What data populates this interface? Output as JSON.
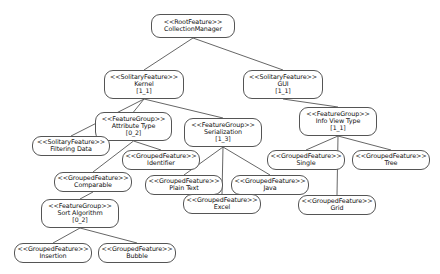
{
  "diagram": {
    "edge_color": "#555555",
    "node_border_color": "#555555",
    "node_fill_color": "#ffffff",
    "background_color": "#ffffff"
  },
  "nodes": [
    {
      "id": "collection-manager",
      "stereotype": "<<RootFeature>>",
      "name": "CollectionManager",
      "cardinality": "",
      "x": 151,
      "y": 14,
      "w": 84,
      "h": 24
    },
    {
      "id": "kernel",
      "stereotype": "<<SolitaryFeature>>",
      "name": "Kernel",
      "cardinality": "[1_1]",
      "x": 104,
      "y": 70,
      "w": 80,
      "h": 29
    },
    {
      "id": "gui",
      "stereotype": "<<SolitaryFeature>>",
      "name": "GUI",
      "cardinality": "[1_1]",
      "x": 243,
      "y": 70,
      "w": 80,
      "h": 29
    },
    {
      "id": "attribute-type",
      "stereotype": "<<FeatureGroup>>",
      "name": "Attribute Type",
      "cardinality": "[0_2]",
      "x": 95,
      "y": 112,
      "w": 77,
      "h": 29
    },
    {
      "id": "serialization",
      "stereotype": "<<FeatureGroup>>",
      "name": "Serialization",
      "cardinality": "[1_3]",
      "x": 184,
      "y": 118,
      "w": 78,
      "h": 29
    },
    {
      "id": "info-view-type",
      "stereotype": "<<FeatureGroup>>",
      "name": "Info View Type",
      "cardinality": "[1_1]",
      "x": 299,
      "y": 107,
      "w": 78,
      "h": 29
    },
    {
      "id": "filtering-data",
      "stereotype": "<<SolitaryFeature>>",
      "name": "Filtering Data",
      "cardinality": "",
      "x": 32,
      "y": 136,
      "w": 78,
      "h": 20
    },
    {
      "id": "identifier",
      "stereotype": "<<GroupedFeature>>",
      "name": "Identifier",
      "cardinality": "",
      "x": 122,
      "y": 150,
      "w": 78,
      "h": 20
    },
    {
      "id": "single",
      "stereotype": "<<GroupedFeature>>",
      "name": "Single",
      "cardinality": "",
      "x": 267,
      "y": 150,
      "w": 78,
      "h": 20
    },
    {
      "id": "tree",
      "stereotype": "<<GroupedFeature>>",
      "name": "Tree",
      "cardinality": "",
      "x": 352,
      "y": 150,
      "w": 78,
      "h": 20
    },
    {
      "id": "comparable",
      "stereotype": "<<GroupedFeature>>",
      "name": "Comparable",
      "cardinality": "",
      "x": 54,
      "y": 172,
      "w": 78,
      "h": 20
    },
    {
      "id": "plain-text",
      "stereotype": "<<GroupedFeature>>",
      "name": "Plain Text",
      "cardinality": "",
      "x": 145,
      "y": 175,
      "w": 78,
      "h": 20
    },
    {
      "id": "java",
      "stereotype": "<<GroupedFeature>>",
      "name": "Java",
      "cardinality": "",
      "x": 231,
      "y": 175,
      "w": 78,
      "h": 20
    },
    {
      "id": "excel",
      "stereotype": "<<GroupedFeature>>",
      "name": "Excel",
      "cardinality": "",
      "x": 183,
      "y": 194,
      "w": 78,
      "h": 20
    },
    {
      "id": "grid",
      "stereotype": "<<GroupedFeature>>",
      "name": "Grid",
      "cardinality": "",
      "x": 298,
      "y": 195,
      "w": 78,
      "h": 20
    },
    {
      "id": "sort-algorithm",
      "stereotype": "<<FeatureGroup>>",
      "name": "Sort Algorithm",
      "cardinality": "[0_2]",
      "x": 41,
      "y": 199,
      "w": 78,
      "h": 29
    },
    {
      "id": "insertion",
      "stereotype": "<<GroupedFeature>>",
      "name": "Insertion",
      "cardinality": "",
      "x": 14,
      "y": 243,
      "w": 78,
      "h": 20
    },
    {
      "id": "bubble",
      "stereotype": "<<GroupedFeature>>",
      "name": "Bubble",
      "cardinality": "",
      "x": 98,
      "y": 243,
      "w": 78,
      "h": 20
    }
  ],
  "edges": [
    {
      "from": "collection-manager",
      "to": "kernel"
    },
    {
      "from": "collection-manager",
      "to": "gui"
    },
    {
      "from": "kernel",
      "to": "filtering-data"
    },
    {
      "from": "kernel",
      "to": "attribute-type"
    },
    {
      "from": "kernel",
      "to": "serialization"
    },
    {
      "from": "gui",
      "to": "info-view-type"
    },
    {
      "from": "attribute-type",
      "to": "identifier"
    },
    {
      "from": "attribute-type",
      "to": "comparable"
    },
    {
      "from": "serialization",
      "to": "plain-text"
    },
    {
      "from": "serialization",
      "to": "excel"
    },
    {
      "from": "serialization",
      "to": "java"
    },
    {
      "from": "info-view-type",
      "to": "single"
    },
    {
      "from": "info-view-type",
      "to": "tree"
    },
    {
      "from": "info-view-type",
      "to": "grid"
    },
    {
      "from": "comparable",
      "to": "sort-algorithm"
    },
    {
      "from": "sort-algorithm",
      "to": "insertion"
    },
    {
      "from": "sort-algorithm",
      "to": "bubble"
    }
  ]
}
